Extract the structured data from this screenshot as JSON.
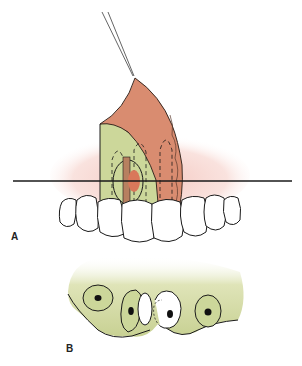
{
  "figure": {
    "panels": [
      {
        "id": "A",
        "label": "A",
        "description": "Frontal view of maxillary anterior teeth with mucoperiosteal flap reflected upward by suture; horizontal line marks cross-section level"
      },
      {
        "id": "B",
        "label": "B",
        "description": "Occlusal cross-section of alveolar bone with tooth roots; one root fractured/displaced"
      }
    ],
    "colors": {
      "flap": "#d98c70",
      "bone": "#ccd79a",
      "gingiva_glow": "#f6d2cc",
      "outline": "#1a1a1a",
      "tooth": "#ffffff"
    }
  }
}
